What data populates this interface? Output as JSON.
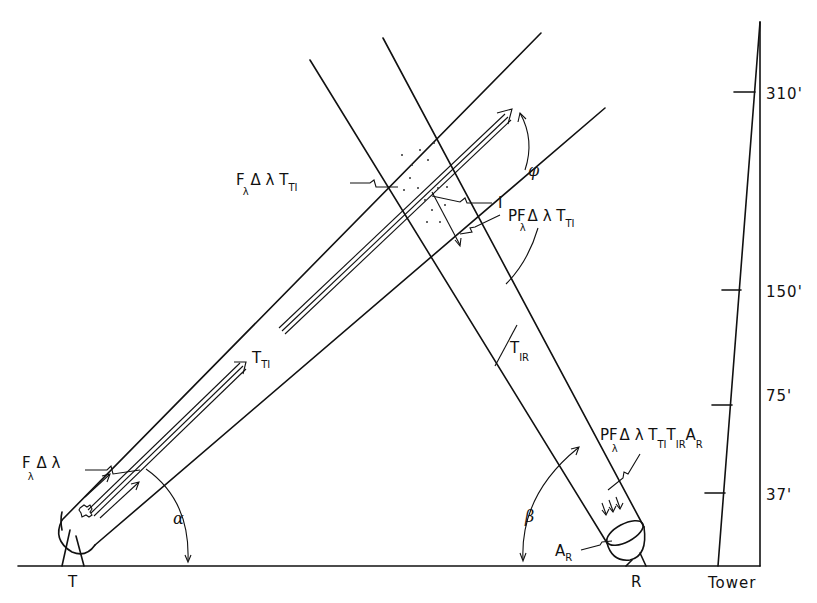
{
  "diagram": {
    "title": "",
    "nodes": {
      "transmitter": "T",
      "receiver": "R",
      "tower": "Tower",
      "intersection": "I"
    },
    "tower_heights": [
      "310'",
      "150'",
      "75'",
      "37'"
    ],
    "angles": {
      "alpha": "α",
      "beta": "β",
      "phi": "φ"
    },
    "labels": {
      "source_flux": {
        "main": "F",
        "sub_lambda": "λ",
        "rest": "Δ λ"
      },
      "flux_at_I": {
        "main": "F",
        "sub_lambda": "λ",
        "rest": "Δ λ T",
        "sub": "TI"
      },
      "scattered": {
        "main": "PF",
        "sub_lambda": "λ",
        "rest": "Δ λ T",
        "sub": "TI"
      },
      "received": {
        "main": "PF",
        "sub_lambda": "λ",
        "rest": "Δ λ T",
        "sub1": "TI",
        "mid": "T",
        "sub2": "IR",
        "end": "A",
        "sub3": "R"
      },
      "transmittance_TI": {
        "main": "T",
        "sub": "TI"
      },
      "transmittance_IR": {
        "main": "T",
        "sub": "IR"
      },
      "receiver_area": {
        "main": "A",
        "sub": "R"
      }
    }
  }
}
